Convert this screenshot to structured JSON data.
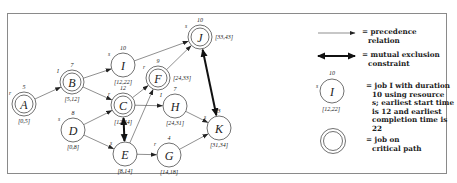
{
  "diagram": {
    "nodes": [
      {
        "id": "A",
        "label": "A",
        "duration": "5",
        "resource": "r",
        "times": "[0,5]",
        "critical": true,
        "cx": 24,
        "cy": 104
      },
      {
        "id": "B",
        "label": "B",
        "duration": "7",
        "resource": "I",
        "times": "[5,12]",
        "critical": true,
        "cx": 72,
        "cy": 82
      },
      {
        "id": "D",
        "label": "D",
        "duration": "8",
        "resource": "s",
        "times": "[0,8]",
        "critical": false,
        "cx": 73,
        "cy": 130
      },
      {
        "id": "I",
        "label": "I",
        "duration": "10",
        "resource": "s",
        "times": "[12,22]",
        "critical": false,
        "cx": 123,
        "cy": 65
      },
      {
        "id": "C",
        "label": "C",
        "duration": "12",
        "resource": "r",
        "times": "[12,24]",
        "critical": true,
        "cx": 123,
        "cy": 105
      },
      {
        "id": "E",
        "label": "E",
        "duration": "6",
        "resource": "s",
        "times": "[8,14]",
        "critical": false,
        "cx": 125,
        "cy": 154
      },
      {
        "id": "F",
        "label": "F",
        "duration": "9",
        "resource": "r",
        "times": "[24,33]",
        "critical": true,
        "cx": 158,
        "cy": 78
      },
      {
        "id": "H",
        "label": "H",
        "duration": "7",
        "resource": "I",
        "times": "[24,31]",
        "critical": false,
        "cx": 175,
        "cy": 106
      },
      {
        "id": "G",
        "label": "G",
        "duration": "4",
        "resource": "r",
        "times": "[14,18]",
        "critical": false,
        "cx": 169,
        "cy": 155
      },
      {
        "id": "J",
        "label": "J",
        "duration": "10",
        "resource": "s",
        "times": "[33,43]",
        "critical": true,
        "cx": 200,
        "cy": 37
      },
      {
        "id": "K",
        "label": "K",
        "duration": "3",
        "resource": "s",
        "times": "[31,34]",
        "critical": false,
        "cx": 219,
        "cy": 128
      }
    ],
    "precedence_edges": [
      [
        "A",
        "B"
      ],
      [
        "B",
        "I"
      ],
      [
        "B",
        "C"
      ],
      [
        "D",
        "C"
      ],
      [
        "D",
        "E"
      ],
      [
        "I",
        "J"
      ],
      [
        "C",
        "F"
      ],
      [
        "C",
        "H"
      ],
      [
        "E",
        "F"
      ],
      [
        "E",
        "G"
      ],
      [
        "F",
        "J"
      ],
      [
        "H",
        "K"
      ],
      [
        "G",
        "K"
      ]
    ],
    "mutual_exclusion_edges": [
      [
        "C",
        "E"
      ],
      [
        "J",
        "K"
      ]
    ]
  },
  "legend": {
    "precedence_label_line1": "= precedence",
    "precedence_label_line2": "relation",
    "mutex_label_line1": "= mutual exclusion",
    "mutex_label_line2": "constraint",
    "example_node": {
      "label": "I",
      "duration": "10",
      "resource": "s",
      "times": "[12,22]"
    },
    "job_desc_lines": [
      "= job I with duration",
      "10 using resource",
      "s; earliest start time",
      "is 12 and earliest",
      "completion time is 22"
    ],
    "critical_label_line1": "= job on",
    "critical_label_line2": "critical path"
  },
  "colors": {
    "stroke": "#333333",
    "text": "#222222",
    "frame": "#8a8a8a"
  }
}
